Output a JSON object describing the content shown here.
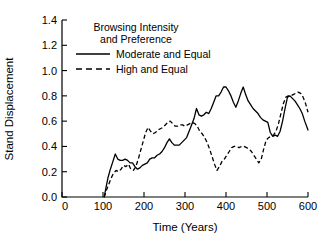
{
  "chart_data": {
    "type": "line",
    "title": "",
    "xlabel": "Time (Years)",
    "ylabel": "Stand Displacement",
    "xlim": [
      0,
      600
    ],
    "ylim": [
      0.0,
      1.4
    ],
    "xticks": [
      0,
      100,
      200,
      300,
      400,
      500,
      600
    ],
    "xtick_labels": [
      "0",
      "100",
      "200",
      "300",
      "400",
      "500",
      "600"
    ],
    "yticks": [
      0.0,
      0.2,
      0.4,
      0.6,
      0.8,
      1.0,
      1.2,
      1.4
    ],
    "ytick_labels": [
      "0.0",
      "0.2",
      "0.4",
      "0.6",
      "0.8",
      "1.0",
      "1.2",
      "1.4"
    ],
    "grid": false,
    "legend_position": "upper-center",
    "legend_title_line1": "Browsing Intensity",
    "legend_title_line2": "and Preference",
    "series": [
      {
        "name": "Moderate and Equal",
        "style": "solid",
        "color": "#000000",
        "x": [
          103,
          107,
          112,
          118,
          124,
          130,
          136,
          142,
          148,
          154,
          160,
          166,
          172,
          178,
          184,
          190,
          196,
          202,
          208,
          214,
          220,
          226,
          232,
          238,
          244,
          250,
          256,
          262,
          268,
          274,
          280,
          286,
          292,
          298,
          304,
          310,
          316,
          322,
          328,
          334,
          340,
          346,
          352,
          358,
          364,
          370,
          376,
          382,
          388,
          394,
          400,
          406,
          412,
          418,
          424,
          430,
          436,
          442,
          448,
          454,
          460,
          466,
          472,
          478,
          484,
          490,
          496,
          502,
          508,
          514,
          520,
          526,
          532,
          538,
          544,
          550,
          556,
          562,
          568,
          574,
          580,
          586,
          592,
          600
        ],
        "y": [
          0.0,
          0.07,
          0.15,
          0.22,
          0.28,
          0.34,
          0.3,
          0.29,
          0.29,
          0.3,
          0.29,
          0.27,
          0.27,
          0.24,
          0.22,
          0.23,
          0.25,
          0.26,
          0.27,
          0.3,
          0.31,
          0.31,
          0.33,
          0.34,
          0.36,
          0.39,
          0.43,
          0.46,
          0.43,
          0.41,
          0.41,
          0.41,
          0.43,
          0.45,
          0.47,
          0.52,
          0.57,
          0.62,
          0.7,
          0.65,
          0.64,
          0.65,
          0.67,
          0.66,
          0.7,
          0.75,
          0.8,
          0.8,
          0.83,
          0.87,
          0.87,
          0.84,
          0.8,
          0.75,
          0.71,
          0.76,
          0.82,
          0.87,
          0.81,
          0.76,
          0.73,
          0.7,
          0.68,
          0.66,
          0.63,
          0.61,
          0.6,
          0.59,
          0.51,
          0.48,
          0.49,
          0.48,
          0.52,
          0.6,
          0.7,
          0.79,
          0.8,
          0.78,
          0.76,
          0.73,
          0.7,
          0.66,
          0.6,
          0.53
        ]
      },
      {
        "name": "High and Equal",
        "style": "dashed",
        "color": "#000000",
        "x": [
          103,
          108,
          114,
          120,
          126,
          132,
          138,
          144,
          150,
          156,
          162,
          168,
          174,
          180,
          186,
          192,
          198,
          204,
          210,
          216,
          222,
          228,
          234,
          240,
          246,
          252,
          258,
          264,
          270,
          276,
          282,
          288,
          294,
          300,
          306,
          312,
          318,
          324,
          330,
          336,
          342,
          348,
          354,
          360,
          366,
          372,
          378,
          384,
          390,
          396,
          402,
          408,
          414,
          420,
          426,
          432,
          438,
          444,
          450,
          456,
          462,
          468,
          474,
          480,
          486,
          492,
          498,
          504,
          510,
          516,
          522,
          528,
          534,
          540,
          546,
          552,
          558,
          564,
          570,
          576,
          582,
          588,
          594,
          600
        ],
        "y": [
          0.0,
          0.05,
          0.1,
          0.15,
          0.19,
          0.21,
          0.2,
          0.22,
          0.25,
          0.24,
          0.26,
          0.22,
          0.21,
          0.24,
          0.3,
          0.37,
          0.44,
          0.51,
          0.55,
          0.52,
          0.5,
          0.51,
          0.53,
          0.54,
          0.55,
          0.57,
          0.59,
          0.6,
          0.58,
          0.56,
          0.56,
          0.57,
          0.57,
          0.56,
          0.57,
          0.58,
          0.59,
          0.58,
          0.56,
          0.52,
          0.5,
          0.47,
          0.43,
          0.38,
          0.32,
          0.26,
          0.21,
          0.24,
          0.28,
          0.3,
          0.33,
          0.36,
          0.39,
          0.4,
          0.4,
          0.39,
          0.4,
          0.4,
          0.39,
          0.38,
          0.36,
          0.33,
          0.3,
          0.27,
          0.3,
          0.38,
          0.45,
          0.47,
          0.48,
          0.49,
          0.52,
          0.58,
          0.66,
          0.74,
          0.79,
          0.8,
          0.8,
          0.81,
          0.82,
          0.83,
          0.82,
          0.79,
          0.74,
          0.67
        ]
      }
    ]
  }
}
